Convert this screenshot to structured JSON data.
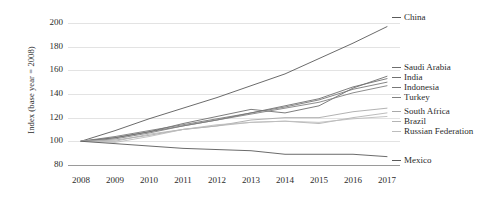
{
  "chart_data": {
    "type": "line",
    "title": "",
    "xlabel": "",
    "ylabel": "Index (base year = 2008)",
    "x": [
      2008,
      2009,
      2010,
      2011,
      2012,
      2013,
      2014,
      2015,
      2016,
      2017
    ],
    "xticklabels": [
      "2008",
      "2009",
      "2010",
      "2011",
      "2012",
      "2013",
      "2014",
      "2015",
      "2016",
      "2017"
    ],
    "yticklabels": [
      "80",
      "100",
      "120",
      "140",
      "160",
      "180",
      "200"
    ],
    "yticks": [
      80,
      100,
      120,
      140,
      160,
      180,
      200
    ],
    "ylim": [
      74,
      206
    ],
    "xlim": [
      2007.6,
      2017.4
    ],
    "grid": "horizontal",
    "legend_position": "right-of-plot-at-line-end",
    "series": [
      {
        "name": "China",
        "color": "#5a5a5a",
        "values": [
          100,
          109,
          119,
          128,
          137,
          147,
          157,
          170,
          183,
          197
        ]
      },
      {
        "name": "Saudi Arabia",
        "color": "#6e6e6e",
        "values": [
          100,
          103,
          108,
          115,
          121,
          127,
          124,
          130,
          145,
          155
        ]
      },
      {
        "name": "India",
        "color": "#707070",
        "values": [
          100,
          103,
          108,
          113,
          118,
          124,
          130,
          136,
          146,
          153
        ]
      },
      {
        "name": "Indonesia",
        "color": "#787878",
        "values": [
          100,
          104,
          109,
          114,
          119,
          124,
          129,
          135,
          144,
          150
        ]
      },
      {
        "name": "Turkey",
        "color": "#808080",
        "values": [
          100,
          102,
          107,
          113,
          118,
          123,
          128,
          133,
          141,
          147
        ]
      },
      {
        "name": "South Africa",
        "color": "#a9a9a9",
        "values": [
          100,
          101,
          105,
          110,
          113,
          118,
          120,
          120,
          125,
          128
        ]
      },
      {
        "name": "Brazil",
        "color": "#b4b4b4",
        "values": [
          100,
          100,
          106,
          110,
          113,
          116,
          117,
          115,
          120,
          124
        ]
      },
      {
        "name": "Russian Federation",
        "color": "#bdbdbd",
        "values": [
          100,
          99,
          104,
          110,
          114,
          116,
          117,
          116,
          119,
          121
        ]
      },
      {
        "name": "Mexico",
        "color": "#5a5a5a",
        "values": [
          100,
          98,
          96,
          94,
          93,
          92,
          89,
          89,
          89,
          87
        ]
      }
    ]
  },
  "axis": {
    "y_title": "Index (base year = 2008)"
  },
  "legend": {
    "items": [
      {
        "label": "China",
        "y": 12
      },
      {
        "label": "Saudi Arabia",
        "y": 62
      },
      {
        "label": "India",
        "y": 72
      },
      {
        "label": "Indonesia",
        "y": 82
      },
      {
        "label": "Turkey",
        "y": 92
      },
      {
        "label": "South Africa",
        "y": 106
      },
      {
        "label": "Brazil",
        "y": 116
      },
      {
        "label": "Russian Federation",
        "y": 126
      },
      {
        "label": "Mexico",
        "y": 155
      }
    ]
  }
}
